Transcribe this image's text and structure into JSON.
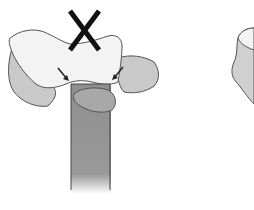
{
  "diagram": {
    "panels": [
      {
        "id": "left",
        "marker": "x-mark",
        "marker_meaning": "incorrect",
        "arrows": 2
      },
      {
        "id": "right",
        "marker": null
      }
    ],
    "colors": {
      "light_bone": "#f2f2f2",
      "mid_bone": "#c8c8c8",
      "shaft": "#8f8f8f",
      "outline": "#555555",
      "x_mark": "#111111"
    }
  }
}
